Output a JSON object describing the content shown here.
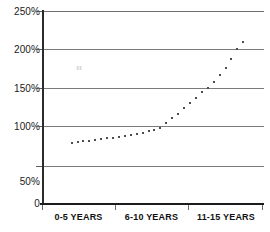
{
  "chart_data": {
    "type": "scatter",
    "title": "",
    "subtitle": "",
    "xlabel": "",
    "ylabel": "",
    "grid": true,
    "legend": null,
    "x_tick_labels": [
      "0-5 YEARS",
      "6-10 YEARS",
      "11-15 YEARS"
    ],
    "y_tick_labels": [
      "0",
      "50%",
      "100%",
      "150%",
      "200%",
      "250%"
    ],
    "y_tick_values": [
      0,
      50,
      100,
      150,
      200,
      250
    ],
    "ylim": [
      0,
      250
    ],
    "xlim": [
      0,
      15
    ],
    "marker": "square-dot",
    "marker_color": "#4d4d4d",
    "series": [
      {
        "name": "value",
        "x": [
          2.0,
          2.4,
          2.8,
          3.2,
          3.6,
          4.0,
          4.4,
          4.8,
          5.2,
          5.6,
          6.0,
          6.4,
          6.8,
          7.2,
          7.6,
          8.0,
          8.4,
          8.8,
          9.2,
          9.6,
          10.0,
          10.4,
          10.8,
          11.2,
          11.6,
          12.0,
          12.4,
          12.8,
          13.2,
          13.6
        ],
        "values": [
          78,
          79,
          80,
          81,
          82,
          83,
          84,
          85,
          86,
          87,
          88,
          90,
          91,
          93,
          95,
          98,
          104,
          110,
          116,
          123,
          130,
          137,
          144,
          150,
          158,
          166,
          176,
          188,
          200,
          210
        ]
      }
    ]
  }
}
